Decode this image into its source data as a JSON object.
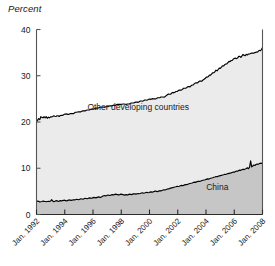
{
  "chart_data": {
    "type": "area",
    "title": "",
    "subtitle": "",
    "ylabel": "Percent",
    "xlabel": "",
    "ylim": [
      0,
      40
    ],
    "yticks": [
      0,
      10,
      20,
      30,
      40
    ],
    "ytick_labels": [
      "0",
      "10",
      "20",
      "30",
      "40"
    ],
    "xtick_labels": [
      "Jan. 1992",
      "Jan. 1994",
      "Jan. 1996",
      "Jan. 1998",
      "Jan. 2000",
      "Jan. 2002",
      "Jan. 2004",
      "Jan. 2006",
      "Jan. 2008"
    ],
    "x_start": "Jan. 1992",
    "x_end": "Jan. 2008",
    "grid": false,
    "legend_position": "inline-annotation",
    "stacked": true,
    "annotations": [
      {
        "text": "Other developing countries",
        "x_frac": 0.45,
        "y_value": 22.5
      },
      {
        "text": "China",
        "x_frac": 0.8,
        "y_value": 5.3
      }
    ],
    "colors": {
      "other_developing_fill": "#ebebeb",
      "china_fill": "#c6c6c6",
      "line": "#000000",
      "axis": "#555555",
      "text": "#1a1a1a",
      "background": "#ffffff"
    },
    "series": [
      {
        "name": "China",
        "fill": "#c6c6c6",
        "values": [
          2.8,
          2.9,
          2.85,
          2.7,
          2.75,
          2.8,
          2.9,
          2.85,
          2.8,
          2.75,
          2.8,
          2.85,
          2.8,
          2.9,
          3.2,
          2.9,
          2.75,
          2.85,
          3.0,
          2.95,
          2.85,
          2.9,
          3.0,
          2.95,
          3.0,
          3.05,
          3.1,
          3.0,
          2.95,
          3.05,
          3.15,
          3.1,
          3.05,
          3.1,
          3.2,
          3.15,
          3.2,
          3.3,
          3.25,
          3.2,
          3.3,
          3.4,
          3.35,
          3.3,
          3.4,
          3.5,
          3.45,
          3.4,
          3.5,
          3.6,
          3.55,
          3.5,
          3.6,
          3.7,
          3.65,
          3.6,
          3.7,
          3.8,
          3.75,
          3.7,
          3.8,
          3.95,
          4.05,
          4.1,
          4.0,
          4.1,
          4.2,
          4.15,
          4.1,
          4.2,
          4.3,
          4.25,
          4.3,
          4.4,
          4.35,
          4.3,
          4.25,
          4.3,
          4.4,
          4.35,
          4.3,
          4.2,
          4.25,
          4.3,
          4.2,
          4.3,
          4.4,
          4.35,
          4.3,
          4.4,
          4.5,
          4.45,
          4.4,
          4.5,
          4.55,
          4.5,
          4.55,
          4.65,
          4.7,
          4.6,
          4.65,
          4.75,
          4.8,
          4.7,
          4.75,
          4.85,
          4.9,
          4.85,
          4.9,
          5.0,
          5.1,
          5.0,
          4.95,
          5.05,
          5.15,
          5.1,
          5.2,
          5.3,
          5.35,
          5.3,
          5.4,
          5.5,
          5.55,
          5.6,
          5.7,
          5.75,
          5.8,
          5.9,
          5.95,
          6.0,
          6.1,
          6.05,
          6.1,
          6.2,
          6.3,
          6.25,
          6.3,
          6.4,
          6.5,
          6.45,
          6.55,
          6.65,
          6.7,
          6.75,
          6.8,
          6.9,
          7.0,
          6.95,
          7.05,
          7.15,
          7.2,
          7.15,
          7.25,
          7.35,
          7.4,
          7.45,
          7.5,
          7.6,
          7.7,
          7.65,
          7.75,
          7.85,
          7.9,
          7.95,
          8.05,
          8.1,
          8.2,
          8.15,
          8.25,
          8.35,
          8.4,
          8.45,
          8.55,
          8.6,
          8.7,
          8.65,
          8.75,
          8.85,
          8.9,
          8.95,
          9.0,
          9.1,
          9.2,
          9.15,
          9.3,
          9.4,
          9.35,
          9.5,
          9.6,
          9.55,
          9.7,
          9.8,
          9.7,
          9.85,
          9.95,
          10.1,
          9.9,
          10.2,
          11.6,
          10.3,
          10.5,
          10.7,
          10.6,
          10.8,
          10.9,
          10.85,
          11.0,
          11.1,
          11.05,
          11.1
        ]
      },
      {
        "name": "Other developing countries",
        "fill": "#ebebeb",
        "values": [
          17.2,
          17.5,
          17.9,
          17.8,
          18.4,
          18.2,
          18.0,
          18.3,
          18.1,
          18.4,
          18.0,
          18.2,
          18.1,
          18.2,
          17.9,
          18.3,
          18.6,
          18.4,
          18.2,
          18.4,
          18.5,
          18.3,
          18.4,
          18.5,
          18.4,
          18.5,
          18.6,
          18.7,
          18.8,
          18.6,
          18.5,
          18.7,
          18.8,
          18.7,
          18.6,
          18.8,
          18.9,
          18.8,
          18.9,
          19.0,
          18.9,
          18.8,
          19.0,
          19.1,
          19.0,
          18.9,
          19.1,
          19.2,
          19.1,
          19.0,
          19.2,
          19.3,
          19.2,
          19.1,
          19.3,
          19.4,
          19.3,
          19.2,
          19.4,
          19.5,
          19.4,
          19.3,
          19.2,
          19.1,
          19.3,
          19.2,
          19.1,
          19.3,
          19.4,
          19.3,
          19.2,
          19.4,
          19.3,
          19.2,
          19.4,
          19.5,
          19.6,
          19.5,
          19.4,
          19.5,
          19.6,
          19.7,
          19.6,
          19.5,
          19.7,
          19.6,
          19.5,
          19.7,
          19.8,
          19.7,
          19.6,
          19.8,
          19.9,
          19.8,
          19.7,
          19.9,
          20.0,
          19.9,
          19.8,
          20.0,
          20.1,
          20.0,
          19.9,
          20.1,
          20.2,
          20.1,
          20.0,
          20.2,
          20.1,
          20.0,
          19.9,
          20.1,
          20.3,
          20.2,
          20.1,
          20.3,
          20.2,
          20.1,
          20.0,
          20.2,
          20.3,
          20.4,
          20.5,
          20.4,
          20.3,
          20.5,
          20.6,
          20.4,
          20.5,
          20.6,
          20.5,
          20.7,
          20.8,
          20.7,
          20.6,
          20.8,
          21.0,
          20.9,
          20.8,
          21.0,
          21.1,
          21.0,
          20.9,
          21.1,
          21.2,
          21.1,
          21.3,
          21.5,
          21.4,
          21.3,
          21.5,
          21.7,
          21.6,
          21.5,
          21.7,
          21.8,
          21.9,
          22.1,
          22.0,
          22.2,
          22.4,
          22.3,
          22.5,
          22.7,
          22.6,
          22.8,
          23.0,
          22.9,
          23.1,
          23.3,
          23.2,
          23.4,
          23.6,
          23.5,
          23.7,
          23.9,
          23.8,
          24.0,
          24.2,
          24.1,
          24.3,
          24.2,
          24.4,
          24.6,
          24.5,
          24.3,
          24.5,
          24.7,
          24.6,
          24.4,
          24.6,
          24.8,
          24.7,
          24.5,
          24.7,
          24.4,
          24.8,
          24.5,
          23.2,
          24.6,
          24.4,
          24.2,
          24.4,
          24.3,
          24.2,
          24.4,
          24.5,
          24.3,
          24.6,
          25.0
        ]
      }
    ],
    "total_top_note": "Top boundary = sum of China + Other developing countries"
  }
}
